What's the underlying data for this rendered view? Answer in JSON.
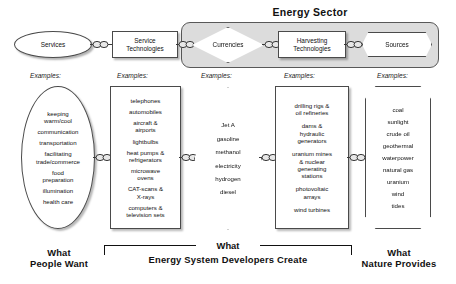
{
  "diagram": {
    "energy_sector_title": "Energy Sector",
    "examples_label": "Examples:",
    "top_row": [
      {
        "id": "services",
        "label": "Services",
        "shape": "ellipse"
      },
      {
        "id": "service-technologies",
        "label": "Service\nTechnologies",
        "shape": "rectangle"
      },
      {
        "id": "currencies",
        "label": "Currencies",
        "shape": "diamond"
      },
      {
        "id": "harvesting-technologies",
        "label": "Harvesting\nTechnologies",
        "shape": "rectangle"
      },
      {
        "id": "sources",
        "label": "Sources",
        "shape": "hexagon"
      }
    ],
    "connectors": [
      {
        "id": "link-services-service-tech",
        "icon": "chain-link-icon"
      },
      {
        "id": "link-service-tech-currencies",
        "icon": "chain-link-icon"
      },
      {
        "id": "link-currencies-harvesting",
        "icon": "chain-link-icon"
      },
      {
        "id": "link-harvesting-sources",
        "icon": "chain-link-icon"
      },
      {
        "id": "link-ex-services-ex-service-tech",
        "icon": "chain-link-icon"
      },
      {
        "id": "link-ex-service-tech-ex-currencies",
        "icon": "chain-link-icon"
      },
      {
        "id": "link-ex-currencies-ex-harvesting",
        "icon": "chain-link-icon"
      },
      {
        "id": "link-ex-harvesting-ex-sources",
        "icon": "chain-link-icon"
      }
    ],
    "examples": {
      "services": [
        "keeping\nwarm/cool",
        "communication",
        "transportation",
        "facilitating\ntrade/commerce",
        "food\npreparation",
        "illumination",
        "health care"
      ],
      "service_technologies": [
        "telephones",
        "automobiles",
        "aircraft &\nairports",
        "lightbulbs",
        "heat pumps &\nrefrigerators",
        "microwave\novens",
        "CAT-scans &\nX-rays",
        "computers &\ntelevision sets"
      ],
      "currencies": [
        "Jet A",
        "gasoline",
        "methanol",
        "electricity",
        "hydrogen",
        "diesel"
      ],
      "harvesting_technologies": [
        "drilling rigs &\noil refineries",
        "dams &\nhydraulic\ngenerators",
        "uranium mines\n& nuclear\ngenerating\nstations",
        "photovoltaic\narrays",
        "wind turbines"
      ],
      "sources": [
        "coal",
        "sunlight",
        "crude oil",
        "geothermal",
        "waterpower",
        "natural gas",
        "uranium",
        "wind",
        "tides"
      ]
    },
    "captions": {
      "left_line1": "What",
      "left_line2": "People Want",
      "middle_line1": "What",
      "middle_line2": "Energy System Developers Create",
      "right_line1": "What",
      "right_line2": "Nature Provides"
    },
    "colors": {
      "energy_sector_fill": "#dcdcdc",
      "shape_fill": "#ffffff",
      "stroke": "#4a4a4a",
      "text": "#111111",
      "background": "#ffffff"
    }
  }
}
